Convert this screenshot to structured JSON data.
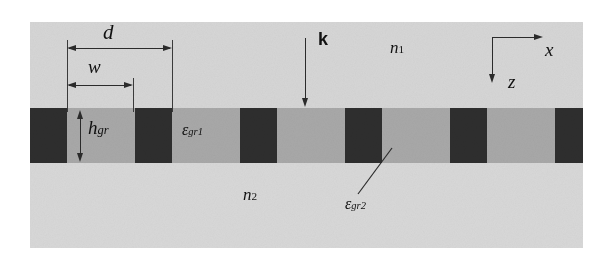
{
  "figure": {
    "type": "binary-diffraction-grating-schematic",
    "labels": {
      "period": "d",
      "ridge_width": "w",
      "grating_height_base": "h",
      "grating_height_sub": "gr",
      "eps1_base": "ε",
      "eps1_sub": "gr1",
      "eps2_base": "ε",
      "eps2_sub": "gr2",
      "n1_base": "n",
      "n1_sub": "1",
      "n2_base": "n",
      "n2_sub": "2",
      "wavevector": "k",
      "axis_x": "x",
      "axis_z": "z"
    },
    "colors": {
      "superstrate": "#d6d6d6",
      "substrate": "#d8d8d8",
      "grating_groove": "#a8a8a8",
      "grating_ridge": "#2e2e2e",
      "ink": "#2b2b2b",
      "page": "#ffffff"
    },
    "geometry": {
      "period_px": 105,
      "ridge_width_px": 37,
      "groove_width_px": 68,
      "grating_top_px": 108,
      "grating_height_px": 55,
      "figure_left_px": 30,
      "figure_right_px": 583,
      "ridge_left_edges_px": [
        30,
        135,
        240,
        345,
        450,
        555
      ]
    }
  }
}
